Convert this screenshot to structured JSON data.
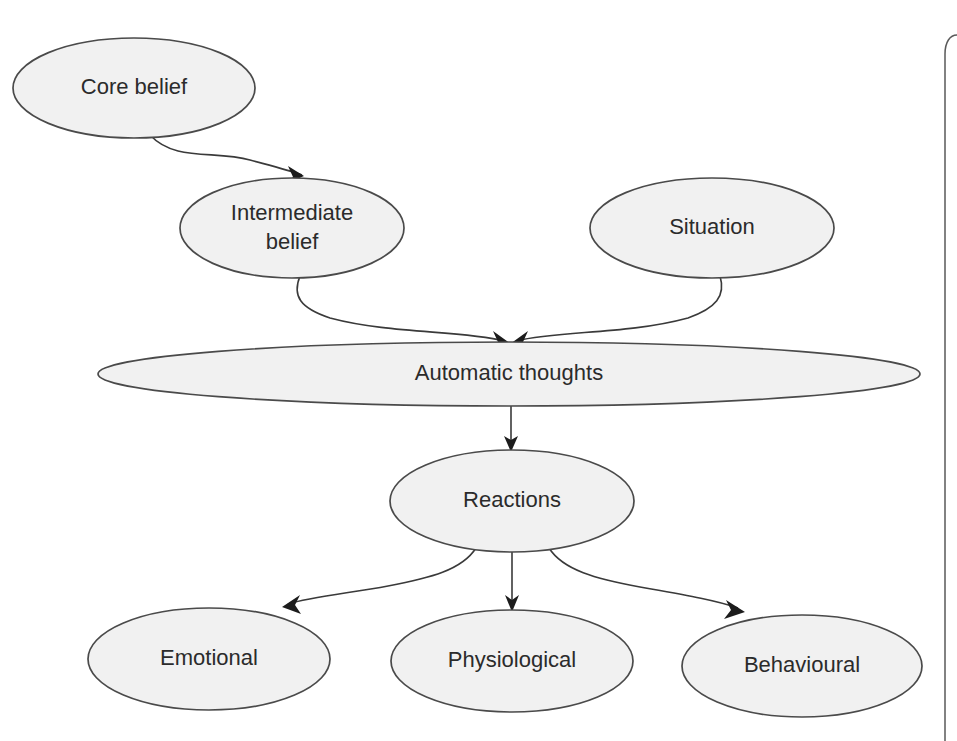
{
  "diagram": {
    "background_color": "#ffffff",
    "node_fill_color": "#f1f1f1",
    "node_stroke_color": "#4a4a4a",
    "edge_color": "#3a3a3a",
    "text_color": "#2b2b2b",
    "nodes": [
      {
        "id": "core-belief",
        "label": "Core belief",
        "label_line1": "Core belief",
        "label_line2": "",
        "cx": 134,
        "cy": 88,
        "rx": 121,
        "ry": 50,
        "font_size": 22
      },
      {
        "id": "intermediate-belief",
        "label": "Intermediate belief",
        "label_line1": "Intermediate",
        "label_line2": "belief",
        "cx": 292,
        "cy": 228,
        "rx": 112,
        "ry": 50,
        "font_size": 22
      },
      {
        "id": "situation",
        "label": "Situation",
        "label_line1": "Situation",
        "label_line2": "",
        "cx": 712,
        "cy": 228,
        "rx": 122,
        "ry": 50,
        "font_size": 22
      },
      {
        "id": "automatic-thoughts",
        "label": "Automatic thoughts",
        "label_line1": "Automatic thoughts",
        "label_line2": "",
        "cx": 509,
        "cy": 374,
        "rx": 411,
        "ry": 32,
        "font_size": 22
      },
      {
        "id": "reactions",
        "label": "Reactions",
        "label_line1": "Reactions",
        "label_line2": "",
        "cx": 512,
        "cy": 501,
        "rx": 122,
        "ry": 51,
        "font_size": 22
      },
      {
        "id": "emotional",
        "label": "Emotional",
        "label_line1": "Emotional",
        "label_line2": "",
        "cx": 209,
        "cy": 659,
        "rx": 121,
        "ry": 51,
        "font_size": 22
      },
      {
        "id": "physiological",
        "label": "Physiological",
        "label_line1": "Physiological",
        "label_line2": "",
        "cx": 512,
        "cy": 661,
        "rx": 121,
        "ry": 51,
        "font_size": 22
      },
      {
        "id": "behavioural",
        "label": "Behavioural",
        "label_line1": "Behavioural",
        "label_line2": "",
        "cx": 802,
        "cy": 666,
        "rx": 120,
        "ry": 51,
        "font_size": 22
      }
    ],
    "edges": [
      {
        "id": "edge-core-to-intermediate",
        "from": "core-belief",
        "to": "intermediate-belief",
        "path": "M 150 135 C 175 162, 215 150, 250 160 C 272 166, 288 170, 302 175",
        "arrow": "M 304 176 L 288 166 L 293 177 L 286 184 Z"
      },
      {
        "id": "edge-intermediate-to-automatic",
        "from": "intermediate-belief",
        "to": "automatic-thoughts",
        "path": "M 300 276 C 292 296, 300 308, 330 318 C 390 334, 460 330, 505 341",
        "arrow": "M 511 344 L 493 331 L 498 342 L 492 351 Z"
      },
      {
        "id": "edge-situation-to-automatic",
        "from": "situation",
        "to": "automatic-thoughts",
        "path": "M 720 276 C 726 296, 716 308, 688 318 C 625 335, 560 330, 516 341",
        "arrow": "M 510 344 L 528 331 L 523 342 L 530 351 Z"
      },
      {
        "id": "edge-automatic-to-reactions",
        "from": "automatic-thoughts",
        "to": "reactions",
        "path": "M 511 406 L 511 443",
        "arrow": "M 511 452 L 504 436 L 511 440 L 518 436 Z"
      },
      {
        "id": "edge-reactions-to-emotional",
        "from": "reactions",
        "to": "emotional",
        "path": "M 476 548 C 462 570, 430 578, 388 586 C 350 593, 310 597, 288 604",
        "arrow": "M 282 607 L 300 595 L 295 605 L 301 614 Z"
      },
      {
        "id": "edge-reactions-to-physiological",
        "from": "reactions",
        "to": "physiological",
        "path": "M 512 552 L 512 601",
        "arrow": "M 512 612 L 505 595 L 512 600 L 519 595 Z"
      },
      {
        "id": "edge-reactions-to-behavioural",
        "from": "reactions",
        "to": "behavioural",
        "path": "M 549 548 C 563 570, 596 579, 640 587 C 685 595, 715 600, 738 608",
        "arrow": "M 745 612 L 726 600 L 731 610 L 724 619 Z"
      }
    ],
    "page_frame": {
      "id": "page-border",
      "path": "M 957 35 C 950 35, 945 42, 945 54 L 945 741",
      "stroke_color": "#5a5a5a"
    }
  }
}
